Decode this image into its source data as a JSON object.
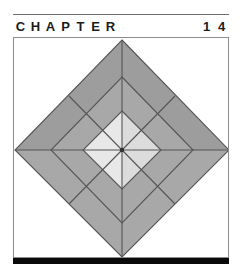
{
  "page": {
    "width": 244,
    "height": 278,
    "background": "#ffffff"
  },
  "header": {
    "rule_color": "#6f6f6f",
    "word_letters": [
      "C",
      "H",
      "A",
      "P",
      "T",
      "E",
      "R"
    ],
    "number_digits": [
      "1",
      "4"
    ],
    "full_text": "CHAPTER 14",
    "chapter_number": "14",
    "text_color": "#1b1b1b"
  },
  "figure": {
    "name": "quilt-block-diamond",
    "frame_border_color": "#8d8d8d",
    "frame_background": "#ffffff",
    "palette": {
      "dark_gray": "#9d9d9d",
      "medium_gray": "#a8a8a8",
      "light_gray": "#c9c9c9",
      "pale_gray": "#dcdcdc",
      "near_white": "#e8e8e8",
      "white": "#ffffff",
      "seam_line": "#555555",
      "outline": "#4a4a4a"
    },
    "geometry": {
      "center_x": 109,
      "center_y": 112,
      "outer_radius_x": 108,
      "outer_radius_y": 110,
      "ring_fractions": [
        1.0,
        0.66,
        0.36
      ]
    }
  },
  "bottom_bar": {
    "color": "#0a0a0a",
    "height": 6
  }
}
